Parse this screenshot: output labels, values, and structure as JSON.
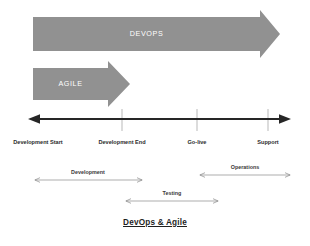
{
  "figure": {
    "caption": "DevOps & Agile",
    "background_color": "#ffffff"
  },
  "colors": {
    "block_arrow_fill": "#919191",
    "block_arrow_text": "#ffffff",
    "axis_line": "#262626",
    "tick_mark": "#bfbfbf",
    "span_arrow": "#8a8a8a",
    "label_text": "#2b2b2b"
  },
  "block_arrows": [
    {
      "label": "DEVOPS",
      "id": "devops",
      "x": 33,
      "y": 17,
      "width": 247,
      "bar_height": 20,
      "head_width": 20,
      "head_height": 34
    },
    {
      "label": "AGILE",
      "id": "agile",
      "x": 33,
      "y": 68,
      "width": 97,
      "bar_height": 18,
      "head_width": 22,
      "head_height": 32
    }
  ],
  "timeline": {
    "axis_y": 119,
    "axis_start_x": 28,
    "axis_end_x": 291,
    "double_headed": true,
    "milestones": [
      {
        "label": "Development Start",
        "x": 38,
        "tick": false
      },
      {
        "label": "Development End",
        "x": 122,
        "tick": true
      },
      {
        "label": "Go-live",
        "x": 197,
        "tick": true
      },
      {
        "label": "Support",
        "x": 268,
        "tick": true
      }
    ],
    "milestone_label_y": 137
  },
  "phase_spans": [
    {
      "label": "Development",
      "x1": 35,
      "x2": 142,
      "y": 180,
      "label_y": 170
    },
    {
      "label": "Operations",
      "x1": 200,
      "x2": 290,
      "y": 175,
      "label_y": 165
    },
    {
      "label": "Testing",
      "x1": 126,
      "x2": 218,
      "y": 201,
      "label_y": 191
    }
  ]
}
